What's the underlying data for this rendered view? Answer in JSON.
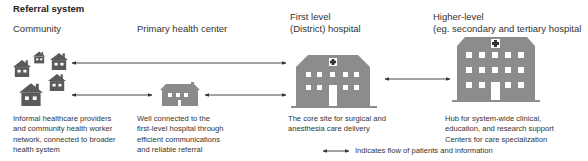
{
  "title": "Referral system",
  "columns": [
    {
      "id": "community",
      "header": [
        "Community"
      ],
      "description": [
        "Informal healthcare providers",
        "and community health worker",
        "network, connected to broader",
        "health system"
      ],
      "icon": "house-cluster-icon"
    },
    {
      "id": "primary",
      "header": [
        "Primary health center"
      ],
      "description": [
        "Well connected to the",
        "first-level hospital through",
        "efficient communications",
        "and reliable referral"
      ],
      "icon": "house-icon"
    },
    {
      "id": "first_level",
      "header": [
        "First level",
        "(District) hospital"
      ],
      "description": [
        "The core site for surgical and",
        "anesthesia care delivery"
      ],
      "icon": "hospital-icon"
    },
    {
      "id": "higher_level",
      "header": [
        "Higher-level",
        "(eg. secondary and tertiary hospital"
      ],
      "description": [
        "Hub for system-wide clinical,",
        "education, and research support",
        "Centers for care specialization"
      ],
      "icon": "large-hospital-icon"
    }
  ],
  "flows": [
    {
      "from": "community",
      "to": "first_level",
      "type": "bidirectional"
    },
    {
      "from": "community",
      "to": "primary",
      "type": "bidirectional"
    },
    {
      "from": "primary",
      "to": "first_level",
      "type": "bidirectional"
    },
    {
      "from": "first_level",
      "to": "higher_level",
      "type": "bidirectional"
    }
  ],
  "legend": {
    "label": "Indicates flow of patients and information",
    "icon": "double-arrow-icon"
  },
  "colors": {
    "community_house": "#5a5a5a",
    "primary_house": "#8a8a8a",
    "hospital": "#8c8c8c",
    "arrow": "#333333",
    "text": "#333333"
  }
}
